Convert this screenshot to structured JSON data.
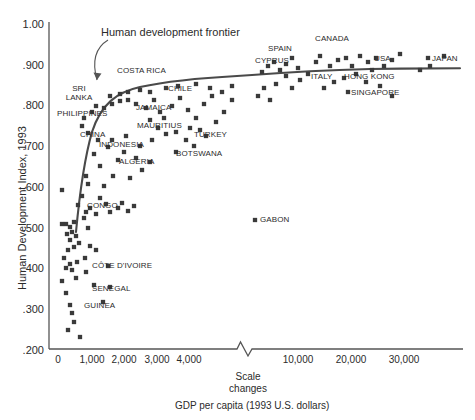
{
  "chart_data": {
    "type": "scatter",
    "title": "",
    "xlabel": "GDP per capita (1993 U.S. dollars)",
    "ylabel": "Human Development Index, 1993",
    "xlim": [
      0,
      36000
    ],
    "ylim": [
      0.2,
      1.0
    ],
    "grid": false,
    "legend": "none",
    "axis_note": "Scale changes",
    "x_scale_break_after": 5000,
    "xticks_lower": [
      "0",
      "1,000",
      "2,000",
      "3,000",
      "4,000"
    ],
    "xtick_values_lower": [
      0,
      1000,
      2000,
      3000,
      4000
    ],
    "xticks_upper": [
      "10,000",
      "20,000",
      "30,000"
    ],
    "xtick_values_upper": [
      10000,
      20000,
      30000
    ],
    "yticks": [
      "1.00",
      ".900",
      ".800",
      ".700",
      ".600",
      ".500",
      ".400",
      ".300",
      ".200"
    ],
    "ytick_values": [
      1.0,
      0.9,
      0.8,
      0.7,
      0.6,
      0.5,
      0.4,
      0.3,
      0.2
    ],
    "annotations": [
      {
        "text": "Human development frontier",
        "type": "curve-callout"
      }
    ],
    "series": [
      {
        "name": "Human development frontier",
        "type": "line",
        "points": [
          [
            320,
            0.705
          ],
          [
            360,
            0.76
          ],
          [
            400,
            0.8
          ],
          [
            460,
            0.83
          ],
          [
            560,
            0.85
          ],
          [
            700,
            0.862
          ],
          [
            900,
            0.872
          ],
          [
            1200,
            0.88
          ],
          [
            1800,
            0.888
          ],
          [
            2600,
            0.895
          ],
          [
            3500,
            0.899
          ],
          [
            4600,
            0.903
          ],
          [
            7000,
            0.912
          ],
          [
            10000,
            0.919
          ],
          [
            14000,
            0.925
          ],
          [
            18000,
            0.928
          ],
          [
            23000,
            0.929
          ],
          [
            28000,
            0.929
          ],
          [
            33500,
            0.929
          ]
        ]
      },
      {
        "name": "Countries",
        "type": "scatter",
        "labeled_points": [
          {
            "label": "SRI\nLANKA",
            "x": 600,
            "y": 0.83
          },
          {
            "label": "PHILIPPINES",
            "x": 800,
            "y": 0.79
          },
          {
            "label": "CHINA",
            "x": 600,
            "y": 0.72
          },
          {
            "label": "COSTA RICA",
            "x": 2300,
            "y": 0.862
          },
          {
            "label": "JAMAICA",
            "x": 1900,
            "y": 0.8
          },
          {
            "label": "MAURITIUS",
            "x": 2300,
            "y": 0.76
          },
          {
            "label": "INDONESIA",
            "x": 1200,
            "y": 0.69
          },
          {
            "label": "ALGERIA",
            "x": 2000,
            "y": 0.67
          },
          {
            "label": "CHILE",
            "x": 3600,
            "y": 0.845
          },
          {
            "label": "TURKEY",
            "x": 3300,
            "y": 0.73
          },
          {
            "label": "BOTSWANA",
            "x": 3200,
            "y": 0.69
          },
          {
            "label": "CONGO",
            "x": 1000,
            "y": 0.56
          },
          {
            "label": "CÔTE D'IVOIRE",
            "x": 900,
            "y": 0.41
          },
          {
            "label": "SENEGAL",
            "x": 900,
            "y": 0.36
          },
          {
            "label": "GUINEA",
            "x": 700,
            "y": 0.32
          },
          {
            "label": "GABON",
            "x": 9000,
            "y": 0.575
          },
          {
            "label": "CYPRUS",
            "x": 9300,
            "y": 0.895
          },
          {
            "label": "SPAIN",
            "x": 11500,
            "y": 0.9
          },
          {
            "label": "ITALY",
            "x": 13500,
            "y": 0.87
          },
          {
            "label": "CANADA",
            "x": 17000,
            "y": 0.93
          },
          {
            "label": "HONG KONG",
            "x": 19000,
            "y": 0.875
          },
          {
            "label": "SINGAPORE",
            "x": 19000,
            "y": 0.845
          },
          {
            "label": "USA",
            "x": 23000,
            "y": 0.915
          },
          {
            "label": "JAPAN",
            "x": 31500,
            "y": 0.915
          }
        ],
        "unlabeled_count": 92
      }
    ]
  },
  "axes": {
    "y_title": "Human Development Index, 1993",
    "x_title": "GDP per capita (1993 U.S. dollars)",
    "scale_break_line1": "Scale",
    "scale_break_line2": "changes"
  },
  "annotation": {
    "frontier_label": "Human development frontier"
  },
  "ytick_labels": [
    {
      "t": "1.00"
    },
    {
      "t": ".900"
    },
    {
      "t": ".800"
    },
    {
      "t": ".700"
    },
    {
      "t": ".600"
    },
    {
      "t": ".500"
    },
    {
      "t": ".400"
    },
    {
      "t": ".300"
    },
    {
      "t": ".200"
    }
  ],
  "xtick_labels": [
    {
      "t": "0"
    },
    {
      "t": "1,000"
    },
    {
      "t": "2,000"
    },
    {
      "t": "3,000"
    },
    {
      "t": "4,000"
    },
    {
      "t": "10,000"
    },
    {
      "t": "20,000"
    },
    {
      "t": "30,000"
    }
  ],
  "point_labels": [
    {
      "t": "SRI"
    },
    {
      "t": "LANKA"
    },
    {
      "t": "PHILIPPINES"
    },
    {
      "t": "CHINA"
    },
    {
      "t": "COSTA RICA"
    },
    {
      "t": "JAMAICA"
    },
    {
      "t": "MAURITIUS"
    },
    {
      "t": "INDONESIA"
    },
    {
      "t": "ALGERIA"
    },
    {
      "t": "CHILE"
    },
    {
      "t": "TURKEY"
    },
    {
      "t": "BOTSWANA"
    },
    {
      "t": "CONGO"
    },
    {
      "t": "CÔTE D'IVOIRE"
    },
    {
      "t": "SENEGAL"
    },
    {
      "t": "GUINEA"
    },
    {
      "t": "GABON"
    },
    {
      "t": "CYPRUS"
    },
    {
      "t": "SPAIN"
    },
    {
      "t": "ITALY"
    },
    {
      "t": "CANADA"
    },
    {
      "t": "HONG KONG"
    },
    {
      "t": "SINGAPORE"
    },
    {
      "t": "USA"
    },
    {
      "t": "JAPAN"
    }
  ],
  "colors": {
    "marker": "#3a3a3a",
    "axis": "#555555",
    "frontier": "#4a4a4a",
    "text": "#2b2b2b",
    "background": "#ffffff"
  }
}
